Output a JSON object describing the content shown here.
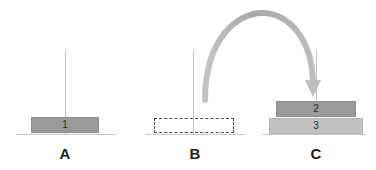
{
  "diagram": {
    "title_fragment": "",
    "scenarios": [
      {
        "id": "A",
        "caption": "A",
        "blocks": [
          {
            "label": "1",
            "style": "solid-dark"
          }
        ]
      },
      {
        "id": "B",
        "caption": "B",
        "blocks": [
          {
            "label": "",
            "style": "dashed-outline"
          }
        ]
      },
      {
        "id": "C",
        "caption": "C",
        "blocks": [
          {
            "label": "2",
            "style": "solid-dark"
          },
          {
            "label": "3",
            "style": "solid-light"
          }
        ]
      }
    ],
    "arrow": {
      "name": "curved-transfer-arrow",
      "from": "B",
      "to": "C",
      "direction": "down"
    },
    "colors": {
      "block_dark": "#9a9a9a",
      "block_light": "#c2c2c2",
      "ground_line": "#c9c9c9",
      "pole_line": "#c2c2c2",
      "arrow": "#b0b0b0",
      "label_text": "#1d1d1d",
      "background": "#ffffff"
    }
  }
}
